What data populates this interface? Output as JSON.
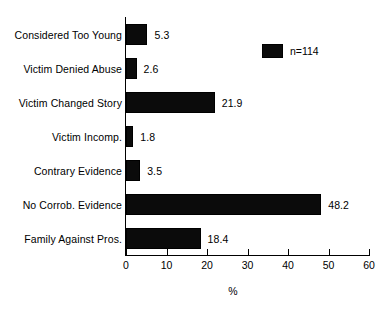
{
  "chart_data": {
    "type": "bar",
    "orientation": "horizontal",
    "title": "",
    "xlabel": "%",
    "ylabel": "",
    "xlim": [
      0,
      60
    ],
    "xticks": [
      0,
      10,
      20,
      30,
      40,
      50,
      60
    ],
    "xtick_labels": [
      "0",
      "10",
      "20",
      "30",
      "40",
      "50",
      "60"
    ],
    "grid": false,
    "legend_position": "top-right",
    "legend_entries": [
      "n=114"
    ],
    "categories": [
      "Considered Too Young",
      "Victim Denied Abuse",
      "Victim Changed Story",
      "Victim Incomp.",
      "Contrary Evidence",
      "No Corrob. Evidence",
      "Family Against Pros."
    ],
    "values": [
      5.3,
      2.6,
      21.9,
      1.8,
      3.5,
      48.2,
      18.4
    ],
    "value_labels": [
      "5.3",
      "2.6",
      "21.9",
      "1.8",
      "3.5",
      "48.2",
      "18.4"
    ],
    "bar_color": "#0B0B0B",
    "axis_color": "#000000",
    "background_color": "#FFFFFF"
  },
  "legend": {
    "n_label": "n=114",
    "swatch_color": "#0B0B0B"
  },
  "axis": {
    "x_title": "%"
  }
}
